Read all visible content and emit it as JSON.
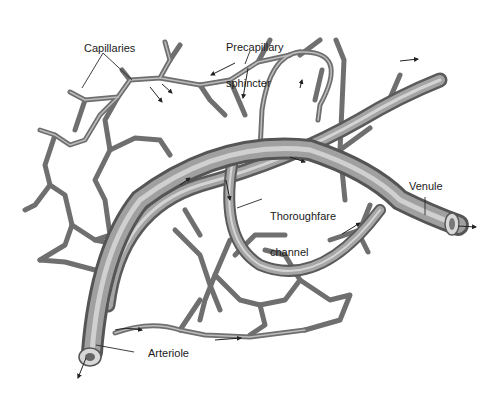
{
  "diagram": {
    "labels": {
      "capillaries": "Capillaries",
      "precapillary_sphincter_line1": "Precapillary",
      "precapillary_sphincter_line2": "sphincter",
      "thoroughfare_channel_line1": "Thoroughfare",
      "thoroughfare_channel_line2": "channel",
      "venule": "Venule",
      "arteriole": "Arteriole"
    },
    "colors": {
      "vessel_fill": "#9a9a9a",
      "vessel_shadow": "#5e5e5e",
      "vessel_highlight": "#d6d6d6",
      "leader_line": "#2a2a2a",
      "background": "#ffffff"
    }
  }
}
